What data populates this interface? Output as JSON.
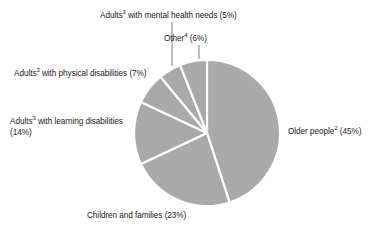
{
  "chart_data": {
    "type": "pie",
    "title": "",
    "subtitle": "",
    "xlabel": "",
    "ylabel": "",
    "legend_position": "none",
    "grid": false,
    "units": "percent",
    "start_angle_deg": 0,
    "direction": "clockwise",
    "colors": {
      "slice_fill": "#a9a9a9",
      "slice_separator": "#ffffff",
      "label_text": "#1a1a1a",
      "leader_line": "#6b6b6b",
      "background": "#ffffff"
    },
    "geometry": {
      "center_x": 207,
      "center_y": 133,
      "radius": 73
    },
    "categories": [
      "Older people",
      "Children and families",
      "Adults with learning disabilities",
      "Adults with physical disabilities",
      "Adults with mental health needs",
      "Other"
    ],
    "values": [
      45,
      23,
      14,
      7,
      5,
      6
    ],
    "slices": [
      {
        "name": "older-people",
        "label_main": "Older people",
        "superscript": "2",
        "value": 45,
        "value_text": "(45%)",
        "label_full": "Older people2 (45%)"
      },
      {
        "name": "children-and-families",
        "label_main": "Children and families",
        "superscript": "",
        "value": 23,
        "value_text": "(23%)",
        "label_full": "Children and families (23%)"
      },
      {
        "name": "adults-learning-disabilities",
        "label_main": "Adults",
        "label_rest": " with learning disabilities",
        "superscript": "3",
        "value": 14,
        "value_text": "(14%)",
        "label_full": "Adults3 with learning disabilities (14%)"
      },
      {
        "name": "adults-physical-disabilities",
        "label_main": "Adults",
        "label_rest": " with physical disabilities ",
        "superscript": "3",
        "value": 7,
        "value_text": "(7%)",
        "label_full": "Adults3 with physical disabilities (7%)"
      },
      {
        "name": "adults-mental-health-needs",
        "label_main": "Adults",
        "label_rest": " with mental health needs ",
        "superscript": "3",
        "value": 5,
        "value_text": "(5%)",
        "label_full": "Adults3 with mental health needs (5%)"
      },
      {
        "name": "other",
        "label_main": "Other",
        "superscript": "4",
        "value": 6,
        "value_text": "(6%)",
        "label_full": "Other4 (6%)"
      }
    ]
  },
  "labels": {
    "mental": {
      "prefix": "Adults",
      "sup": "3",
      "suffix": " with mental health needs (5%)"
    },
    "other": {
      "prefix": "Other",
      "sup": "4",
      "suffix": " (6%)"
    },
    "physical": {
      "prefix": "Adults",
      "sup": "3",
      "suffix": " with physical disabilities (7%)"
    },
    "learning": {
      "prefix": "Adults",
      "sup": "3",
      "suffix": " with learning disabilities",
      "line2": "(14%)"
    },
    "older": {
      "prefix": "Older people",
      "sup": "2",
      "suffix": " (45%)"
    },
    "children": {
      "prefix": "Children and families (23%)",
      "sup": "",
      "suffix": ""
    }
  }
}
